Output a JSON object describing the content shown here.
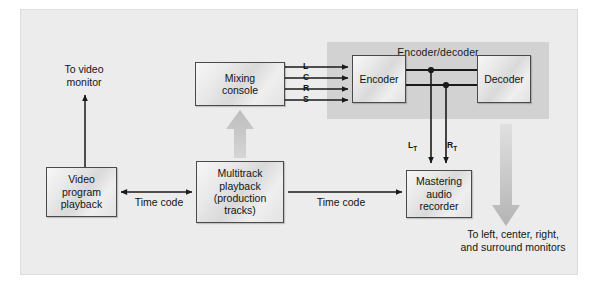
{
  "figure": {
    "panel_title": "Encoder/decoder",
    "background_color": "#ececec",
    "panel_color": "#d2d2d2",
    "line_color": "#1a1a1a",
    "grey_arrow_color": "#c2c2c2"
  },
  "boxes": {
    "mixing_console": "Mixing\nconsole",
    "encoder": "Encoder",
    "decoder": "Decoder",
    "video_program_playback": "Video\nprogram\nplayback",
    "multitrack_playback": "Multitrack\nplayback\n(production\ntracks)",
    "mastering_audio_recorder": "Mastering\naudio\nrecorder"
  },
  "labels": {
    "to_video_monitor": "To video\nmonitor",
    "time_code_left": "Time code",
    "time_code_right": "Time code",
    "to_monitors": "To left, center, right,\nand surround monitors"
  },
  "signals": {
    "L": "L",
    "C": "C",
    "R": "R",
    "S": "S",
    "LT_main": "L",
    "LT_sub": "T",
    "RT_main": "R",
    "RT_sub": "T"
  },
  "diagram_data": {
    "type": "block-diagram",
    "nodes": [
      {
        "id": "video_program_playback",
        "label": "Video program playback",
        "x": 46,
        "y": 167,
        "w": 71,
        "h": 50
      },
      {
        "id": "multitrack_playback",
        "label": "Multitrack playback (production tracks)",
        "x": 196,
        "y": 161,
        "w": 88,
        "h": 62
      },
      {
        "id": "mixing_console",
        "label": "Mixing console",
        "x": 195,
        "y": 62,
        "w": 90,
        "h": 44
      },
      {
        "id": "encoder",
        "label": "Encoder",
        "x": 352,
        "y": 55,
        "w": 54,
        "h": 48
      },
      {
        "id": "decoder",
        "label": "Decoder",
        "x": 477,
        "y": 55,
        "w": 54,
        "h": 48
      },
      {
        "id": "mastering_audio_recorder",
        "label": "Mastering audio recorder",
        "x": 406,
        "y": 170,
        "w": 66,
        "h": 48
      }
    ],
    "groups": [
      {
        "id": "encoder_decoder_group",
        "label": "Encoder/decoder",
        "members": [
          "encoder",
          "decoder"
        ]
      }
    ],
    "edges": [
      {
        "from": "video_program_playback",
        "to": "video_monitor",
        "label": "To video monitor",
        "style": "arrow-up-black"
      },
      {
        "from": "video_program_playback",
        "to": "multitrack_playback",
        "label": "Time code",
        "style": "double-arrow-black"
      },
      {
        "from": "multitrack_playback",
        "to": "mastering_audio_recorder",
        "label": "Time code",
        "style": "arrow-right-black"
      },
      {
        "from": "multitrack_playback",
        "to": "mixing_console",
        "label": "",
        "style": "thick-grey-arrow-up"
      },
      {
        "from": "mixing_console",
        "to": "encoder",
        "label": "L",
        "style": "arrow-right-black"
      },
      {
        "from": "mixing_console",
        "to": "encoder",
        "label": "C",
        "style": "arrow-right-black"
      },
      {
        "from": "mixing_console",
        "to": "encoder",
        "label": "R",
        "style": "arrow-right-black"
      },
      {
        "from": "mixing_console",
        "to": "encoder",
        "label": "S",
        "style": "arrow-right-black"
      },
      {
        "from": "encoder",
        "to": "decoder",
        "label": "LT",
        "style": "line-with-junction"
      },
      {
        "from": "encoder",
        "to": "decoder",
        "label": "RT",
        "style": "line-with-junction"
      },
      {
        "from": "encoder",
        "to": "mastering_audio_recorder",
        "label": "LT",
        "style": "arrow-down-black"
      },
      {
        "from": "encoder",
        "to": "mastering_audio_recorder",
        "label": "RT",
        "style": "arrow-down-black"
      },
      {
        "from": "decoder",
        "to": "monitors",
        "label": "To left, center, right, and surround monitors",
        "style": "thick-grey-arrow-down"
      }
    ]
  }
}
